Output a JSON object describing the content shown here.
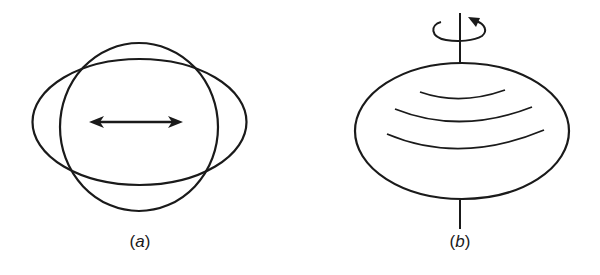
{
  "diagram": {
    "stroke_color": "#1a1a1a",
    "background": "#ffffff",
    "panels": [
      {
        "id": "a",
        "label": "(a)",
        "label_letter": "a",
        "description": "Circle overlaid with horizontally elongated ellipse; double-headed horizontal arrow at center",
        "shapes": {
          "ellipse": {
            "cx": 139.5,
            "cy": 122,
            "rx": 107,
            "ry": 63
          },
          "circle": {
            "cx": 139,
            "cy": 127,
            "rx": 79,
            "ry": 84
          },
          "double_arrow": {
            "x1": 89,
            "x2": 183,
            "y": 122
          }
        },
        "label_position": {
          "x": 140,
          "y": 232
        }
      },
      {
        "id": "b",
        "label": "(b)",
        "label_letter": "b",
        "description": "Oblate ellipsoid on vertical rotation axis with curved rotation arrow at top and three curved latitude lines",
        "shapes": {
          "ellipse": {
            "cx": 462,
            "cy": 131,
            "rx": 107,
            "ry": 68
          },
          "axis_top": {
            "x": 460,
            "y1": 13,
            "y2": 63
          },
          "axis_bottom": {
            "x": 460,
            "y1": 200,
            "y2": 229
          },
          "rotation_arrow": "counter-clockwise (viewed from above) around axis",
          "latitude_lines": 3
        },
        "label_position": {
          "x": 460,
          "y": 232
        }
      }
    ]
  }
}
